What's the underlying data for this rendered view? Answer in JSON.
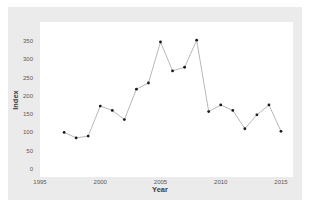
{
  "chart_data": {
    "type": "line",
    "title": "",
    "xlabel": "Year",
    "ylabel": "Index",
    "xlim": [
      1995,
      2016
    ],
    "ylim": [
      0,
      375
    ],
    "x_ticks": [
      1995,
      2000,
      2005,
      2010,
      2015
    ],
    "y_ticks": [
      0,
      50,
      100,
      150,
      200,
      250,
      300,
      350
    ],
    "grid": false,
    "legend": null,
    "x": [
      1997,
      1998,
      1999,
      2000,
      2001,
      2002,
      2003,
      2004,
      2005,
      2006,
      2007,
      2008,
      2009,
      2010,
      2011,
      2012,
      2013,
      2014,
      2015
    ],
    "series": [
      {
        "name": "Index",
        "values": [
          100,
          85,
          90,
          172,
          160,
          135,
          218,
          235,
          347,
          268,
          278,
          352,
          157,
          175,
          160,
          110,
          148,
          175,
          103
        ]
      }
    ],
    "colors": {
      "panel_background": "#ebebeb",
      "plot_background": "#ffffff",
      "line": "#a6a6a6",
      "marker": "#1a1a1a"
    }
  }
}
